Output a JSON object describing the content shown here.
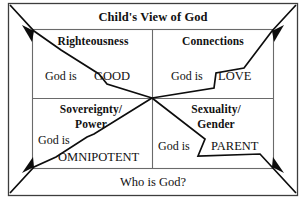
{
  "diagram": {
    "title": "Child's View of God",
    "footer": "Who is God?",
    "central_question_label": "Who is God?",
    "quadrants": [
      {
        "id": "righteousness",
        "position": "top-left",
        "heading": "Righteousness",
        "statement_prefix": "God is",
        "attribute": "GOOD"
      },
      {
        "id": "connections",
        "position": "top-right",
        "heading": "Connections",
        "statement_prefix": "God is",
        "attribute": "LOVE"
      },
      {
        "id": "sovereignty-power",
        "position": "bottom-left",
        "heading_line1": "Sovereignty/",
        "heading_line2": "Power",
        "statement_prefix": "God is",
        "attribute": "OMNIPOTENT"
      },
      {
        "id": "sexuality-gender",
        "position": "bottom-right",
        "heading_line1": "Sexuality/",
        "heading_line2": "Gender",
        "statement_prefix": "God is",
        "attribute": "PARENT"
      }
    ],
    "arrows": [
      {
        "name": "arrow-to-top-left",
        "from": "center",
        "to": "top-left-corner"
      },
      {
        "name": "arrow-to-top-right",
        "from": "center",
        "to": "top-right-corner"
      },
      {
        "name": "arrow-to-bottom-left",
        "from": "center",
        "to": "bottom-left-corner"
      },
      {
        "name": "arrow-to-bottom-right",
        "from": "center",
        "to": "bottom-right-corner"
      }
    ],
    "colors": {
      "ink": "#111111",
      "line": "#4a4a4a",
      "background": "#ffffff"
    }
  }
}
